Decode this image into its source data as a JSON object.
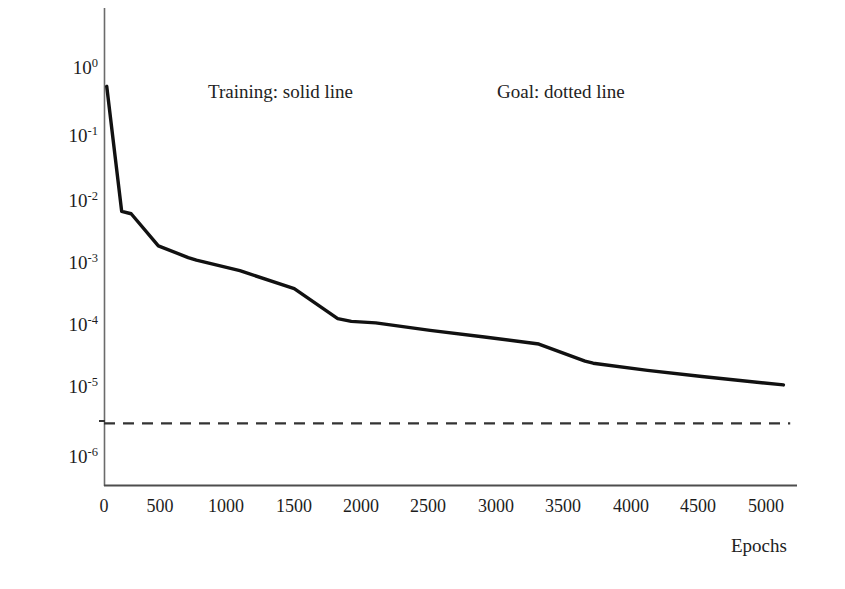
{
  "chart_data": {
    "type": "line",
    "title": "",
    "subtitle": "",
    "xlabel": "Epochs",
    "ylabel": "",
    "xlim": [
      0,
      5100
    ],
    "ylim": [
      3.2e-07,
      1.6
    ],
    "yscale": "log",
    "grid": false,
    "legend_position": "inside-top",
    "xticks": [
      0,
      500,
      1000,
      1500,
      2000,
      2500,
      3000,
      3500,
      4000,
      4500,
      5000
    ],
    "xtick_labels": [
      "0",
      "500",
      "1000",
      "1500",
      "2000",
      "2500",
      "3000",
      "3500",
      "4000",
      "4500",
      "5000"
    ],
    "yticks": [
      1,
      0.1,
      0.01,
      0.001,
      0.0001,
      1e-05,
      1e-06
    ],
    "ytick_labels": [
      "10⁰",
      "10⁻¹",
      "10⁻²",
      "10⁻³",
      "10⁻⁴",
      "10⁻⁵",
      "10⁻⁶"
    ],
    "ytick_mantissa": [
      "10",
      "10",
      "10",
      "10",
      "10",
      "10",
      "10"
    ],
    "ytick_exponent": [
      "0",
      "-1",
      "-2",
      "-3",
      "-4",
      "-5",
      "-6"
    ],
    "series": [
      {
        "name": "Training",
        "style": "solid",
        "color": "#111111",
        "linewidth": 3.4,
        "x": [
          20,
          130,
          200,
          400,
          620,
          680,
          1000,
          1400,
          1720,
          1820,
          2000,
          2400,
          2800,
          3200,
          3540,
          3600,
          4000,
          4400,
          5000
        ],
        "y": [
          0.52,
          0.006,
          0.0055,
          0.00175,
          0.00115,
          0.00105,
          0.00072,
          0.00038,
          0.00013,
          0.000118,
          0.000112,
          8.55e-05,
          6.75e-05,
          5.25e-05,
          2.85e-05,
          2.65e-05,
          2.05e-05,
          1.65e-05,
          1.22e-05
        ]
      },
      {
        "name": "Goal",
        "style": "dashed",
        "color": "#333333",
        "linewidth": 2.2,
        "x": [
          0,
          5050
        ],
        "y": [
          3.1e-06,
          3.1e-06
        ]
      }
    ],
    "annotations": [
      {
        "text": "Training: solid line",
        "x_px": 208,
        "y_px": 82
      },
      {
        "text": "Goal: dotted line",
        "x_px": 497,
        "y_px": 82
      }
    ]
  },
  "axes": {
    "x_axis_label": "Epochs",
    "x_axis_color": "#555555",
    "y_axis_color": "#666666"
  },
  "figure": {
    "background_color": "#ffffff",
    "foreground_color": "#1a1a1a"
  }
}
